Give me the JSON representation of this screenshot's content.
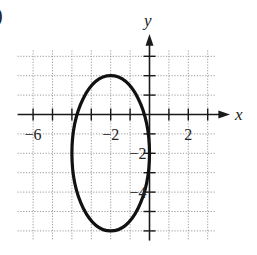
{
  "chart_data": {
    "type": "line",
    "title": "",
    "subtitle": "",
    "part_marker": ")",
    "xlabel": "x",
    "ylabel": "y",
    "xlim": [
      -6.8,
      4.2
    ],
    "ylim": [
      -6.5,
      4.1
    ],
    "grid": true,
    "grid_style": "dotted",
    "x_ticks": [
      -6,
      -5,
      -4,
      -3,
      -2,
      -1,
      1,
      2,
      3
    ],
    "y_ticks": [
      3,
      2,
      1,
      -1,
      -2,
      -3,
      -4,
      -5,
      -6
    ],
    "x_tick_labels": [
      {
        "value": -6,
        "label": "−6"
      },
      {
        "value": -2,
        "label": "−2"
      },
      {
        "value": 2,
        "label": "2"
      }
    ],
    "y_tick_labels": [
      {
        "value": -2,
        "label": "−2"
      },
      {
        "value": -4,
        "label": "−4"
      }
    ],
    "series": [
      {
        "name": "ellipse",
        "shape": "ellipse",
        "center": [
          -2,
          -2
        ],
        "semi_axis_x": 2,
        "semi_axis_y": 4,
        "equation": "(x+2)^2/4 + (y+2)^2/16 = 1",
        "key_points": [
          [
            -2,
            2
          ],
          [
            -2,
            -6
          ],
          [
            -4,
            -2
          ],
          [
            0,
            -2
          ]
        ]
      }
    ],
    "legend": null
  }
}
